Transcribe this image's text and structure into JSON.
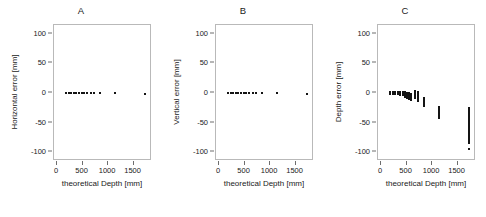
{
  "figure": {
    "background": "#ffffff",
    "point_color": "#141414",
    "frame_color": "#b9b9b9"
  },
  "panels": [
    {
      "title": "A",
      "ylabel": "Horizontal error [mm]",
      "xlabel": "theoretical Depth [mm]"
    },
    {
      "title": "B",
      "ylabel": "Vertical error [mm]",
      "xlabel": "theoretical Depth [mm]"
    },
    {
      "title": "C",
      "ylabel": "Depth error [mm]",
      "xlabel": "theoretical Depth [mm]"
    }
  ],
  "axes": {
    "xticks": [
      0,
      500,
      1000,
      1500
    ],
    "xtick_labels": [
      "0",
      "500",
      "1000",
      "1500"
    ],
    "yticks": [
      100,
      50,
      0,
      -50,
      -100
    ],
    "ytick_labels": [
      "100",
      "50",
      "0",
      "-50",
      "-100"
    ],
    "xlim": [
      -60,
      1860
    ],
    "ylim": [
      -115,
      115
    ],
    "grid": false
  },
  "chart_data": [
    {
      "type": "scatter",
      "title": "A",
      "xlabel": "theoretical Depth [mm]",
      "ylabel": "Horizontal error [mm]",
      "xlim": [
        -60,
        1860
      ],
      "ylim": [
        -115,
        115
      ],
      "grid": false,
      "series": [
        {
          "name": "Horizontal error",
          "x": [
            180,
            230,
            280,
            330,
            380,
            430,
            480,
            530,
            580,
            660,
            720,
            850,
            1140,
            1720
          ],
          "y": [
            0,
            0,
            0,
            0,
            0,
            0,
            0,
            0,
            0,
            0,
            0,
            0,
            0,
            -1
          ]
        }
      ]
    },
    {
      "type": "scatter",
      "title": "B",
      "xlabel": "theoretical Depth [mm]",
      "ylabel": "Vertical error [mm]",
      "xlim": [
        -60,
        1860
      ],
      "ylim": [
        -115,
        115
      ],
      "grid": false,
      "series": [
        {
          "name": "Vertical error",
          "x": [
            180,
            230,
            280,
            330,
            380,
            430,
            480,
            530,
            580,
            660,
            720,
            850,
            1140,
            1720
          ],
          "y": [
            0,
            0,
            0,
            0,
            0,
            0,
            0,
            0,
            0,
            0,
            0,
            0,
            0,
            -2
          ]
        }
      ]
    },
    {
      "type": "scatter",
      "title": "C",
      "xlabel": "theoretical Depth [mm]",
      "ylabel": "Depth error [mm]",
      "xlim": [
        -60,
        1860
      ],
      "ylim": [
        -115,
        115
      ],
      "grid": false,
      "note": "vertical spread of repeated measurements grows and shifts negative with depth",
      "clusters": [
        {
          "x": 180,
          "ymin": -1,
          "ymax": 1
        },
        {
          "x": 230,
          "ymin": -1,
          "ymax": 1
        },
        {
          "x": 280,
          "ymin": -2,
          "ymax": 1
        },
        {
          "x": 330,
          "ymin": -2,
          "ymax": 1
        },
        {
          "x": 380,
          "ymin": -3,
          "ymax": 1
        },
        {
          "x": 430,
          "ymin": -4,
          "ymax": 1
        },
        {
          "x": 470,
          "ymin": -6,
          "ymax": 1
        },
        {
          "x": 510,
          "ymin": -8,
          "ymax": 0
        },
        {
          "x": 550,
          "ymin": -10,
          "ymax": 0
        },
        {
          "x": 590,
          "ymin": -12,
          "ymax": -1
        },
        {
          "x": 660,
          "ymin": -9,
          "ymax": 3
        },
        {
          "x": 720,
          "ymin": -13,
          "ymax": 1
        },
        {
          "x": 850,
          "ymin": -22,
          "ymax": -9
        },
        {
          "x": 1140,
          "ymin": -43,
          "ymax": -23
        },
        {
          "x": 1720,
          "ymin": -85,
          "ymax": -25
        }
      ],
      "outliers": [
        {
          "x": 1720,
          "y": -95
        }
      ]
    }
  ]
}
